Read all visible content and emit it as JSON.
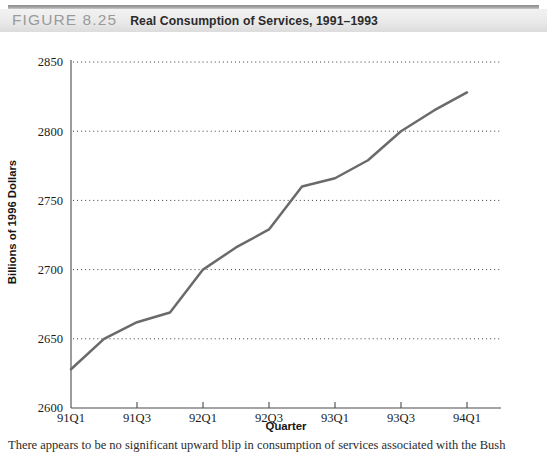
{
  "header": {
    "figure_number": "FIGURE 8.25",
    "figure_title": "Real Consumption of Services, 1991–1993"
  },
  "caption": {
    "text": "There appears to be no significant upward blip in consumption of services associated with the Bush"
  },
  "chart_data": {
    "type": "line",
    "title": "Real Consumption of Services, 1991–1993",
    "xlabel": "Quarter",
    "ylabel": "Billions of 1996 Dollars",
    "x": [
      "91Q1",
      "91Q2",
      "91Q3",
      "91Q4",
      "92Q1",
      "92Q2",
      "92Q3",
      "92Q4",
      "93Q1",
      "93Q2",
      "93Q3",
      "93Q4",
      "94Q1"
    ],
    "values": [
      2628,
      2650,
      2662,
      2669,
      2700,
      2716,
      2729,
      2760,
      2766,
      2779,
      2800,
      2815,
      2828
    ],
    "xtick_labels": [
      "91Q1",
      "91Q3",
      "92Q1",
      "92Q3",
      "93Q1",
      "93Q3",
      "94Q1"
    ],
    "ytick_labels": [
      "2600",
      "2650",
      "2700",
      "2750",
      "2800",
      "2850"
    ],
    "ylim": [
      2600,
      2850
    ],
    "xlim": [
      "91Q1",
      "94Q1"
    ],
    "grid": "horizontal-dotted",
    "legend": "none",
    "series_color": "#6a6a6a",
    "grid_color": "#3b3b3b",
    "axis_color": "#4a4a4a"
  }
}
